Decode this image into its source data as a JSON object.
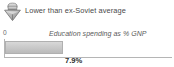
{
  "widget": {
    "caption": {
      "icon": "lower-than-average-icon",
      "text": "Lower than ex-Soviet average"
    }
  },
  "chart_data": {
    "type": "bar",
    "orientation": "horizontal",
    "title": "",
    "series_label": "Education spending as % GNP",
    "categories": [
      "Education spending as % GNP"
    ],
    "values": [
      7.9
    ],
    "value_labels": [
      "7.9%"
    ],
    "unit": "% GNP",
    "xlabel": "",
    "ylabel": "",
    "xlim": [
      0,
      23
    ],
    "axis_tick_labels": [
      "0"
    ],
    "grid": false,
    "legend": "none",
    "bar_color": "#c9c9c9",
    "bar_border_color": "#b0b0b0",
    "axis_color": "#b5b5b5",
    "bar_fill_fraction": 0.345,
    "value_label_left_px": 60
  }
}
